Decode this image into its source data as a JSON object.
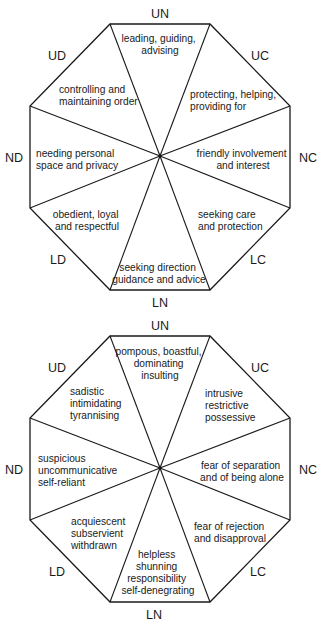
{
  "diagrams": [
    {
      "name": "adaptive",
      "center": [
        160,
        156
      ],
      "labels": {
        "UN": "UN",
        "UC": "UC",
        "NC": "NC",
        "LC": "LC",
        "LN": "LN",
        "LD": "LD",
        "ND": "ND",
        "UD": "UD"
      },
      "sectors": {
        "UN": [
          "leading, guiding,",
          "advising"
        ],
        "UC": [
          "protecting, helping,",
          "providing for"
        ],
        "NC": [
          "friendly involvement",
          "and interest"
        ],
        "LC": [
          "seeking care",
          "and protection"
        ],
        "LN": [
          "seeking direction",
          "guidance and advice"
        ],
        "LD": [
          "obedient, loyal",
          "and respectful"
        ],
        "ND": [
          "needing personal",
          "space and privacy"
        ],
        "UD": [
          "controlling and",
          "maintaining order"
        ]
      }
    },
    {
      "name": "maladaptive",
      "center": [
        160,
        468
      ],
      "labels": {
        "UN": "UN",
        "UC": "UC",
        "NC": "NC",
        "LC": "LC",
        "LN": "LN",
        "LD": "LD",
        "ND": "ND",
        "UD": "UD"
      },
      "sectors": {
        "UN": [
          "pompous, boastful,",
          "dominating",
          "insulting"
        ],
        "UC": [
          "intrusive",
          "restrictive",
          "possessive"
        ],
        "NC": [
          "fear of separation",
          "and of being alone"
        ],
        "LC": [
          "fear of rejection",
          "and disapproval"
        ],
        "LN": [
          "helpless",
          "shunning",
          "responsibility",
          "self-denegrating"
        ],
        "LD": [
          "acquiescent",
          "subservient",
          "withdrawn"
        ],
        "ND": [
          "suspicious",
          "uncommunicative",
          "self-reliant"
        ],
        "UD": [
          "sadistic",
          "intimidating",
          "tyrannising"
        ]
      }
    }
  ],
  "colors": {
    "line": "#1a1a1a",
    "background": "#ffffff"
  }
}
